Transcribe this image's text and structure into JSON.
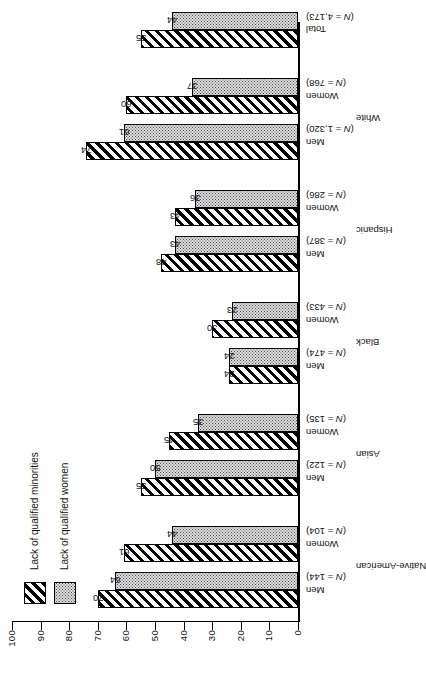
{
  "chart_data": {
    "type": "bar",
    "title": "",
    "subtitle": "",
    "xlabel": "",
    "ylabel": "",
    "orientation": "vertical-bars-rotated-90ccw",
    "ylim": [
      0,
      100
    ],
    "yticks": [
      0,
      10,
      20,
      30,
      40,
      50,
      60,
      70,
      80,
      90,
      100
    ],
    "ytick_labels": [
      "0",
      "10",
      "20",
      "30",
      "40",
      "50",
      "60",
      "70",
      "80",
      "90",
      "100"
    ],
    "grid": false,
    "legend_position": "left-middle",
    "categories": [
      "Native-American Men",
      "Native-American Women",
      "Asian Men",
      "Asian Women",
      "Black Men",
      "Black Women",
      "Hispanic Men",
      "Hispanic Women",
      "White Men",
      "White Women",
      "Total"
    ],
    "series": [
      {
        "name": "Lack of qualified minorities",
        "pattern": "diagonal-hatch",
        "values": [
          70,
          61,
          55,
          45,
          24,
          30,
          48,
          43,
          74,
          60,
          55
        ]
      },
      {
        "name": "Lack of qualified women",
        "pattern": "stipple-dots",
        "values": [
          64,
          44,
          50,
          35,
          24,
          23,
          43,
          36,
          61,
          37,
          44
        ]
      }
    ],
    "groups": [
      {
        "name": "Native-American",
        "columns": [
          {
            "sex": "Men",
            "n_label": "(N = 144)",
            "minorities": 70,
            "women": 64
          },
          {
            "sex": "Women",
            "n_label": "(N = 104)",
            "minorities": 61,
            "women": 44
          }
        ]
      },
      {
        "name": "Asian",
        "columns": [
          {
            "sex": "Men",
            "n_label": "(N = 122)",
            "minorities": 55,
            "women": 50
          },
          {
            "sex": "Women",
            "n_label": "(N = 135)",
            "minorities": 45,
            "women": 35
          }
        ]
      },
      {
        "name": "Black",
        "columns": [
          {
            "sex": "Men",
            "n_label": "(N = 474)",
            "minorities": 24,
            "women": 24
          },
          {
            "sex": "Women",
            "n_label": "(N = 433)",
            "minorities": 30,
            "women": 23
          }
        ]
      },
      {
        "name": "Hispanic",
        "columns": [
          {
            "sex": "Men",
            "n_label": "(N = 387)",
            "minorities": 48,
            "women": 43
          },
          {
            "sex": "Women",
            "n_label": "(N = 286)",
            "minorities": 43,
            "women": 36
          }
        ]
      },
      {
        "name": "White",
        "columns": [
          {
            "sex": "Men",
            "n_label": "(N = 1,320)",
            "minorities": 74,
            "women": 61
          },
          {
            "sex": "Women",
            "n_label": "(N = 768)",
            "minorities": 60,
            "women": 37
          }
        ]
      },
      {
        "name": "Total",
        "columns": [
          {
            "sex": "",
            "n_label": "(N = 4,173)",
            "minorities": 55,
            "women": 44
          }
        ]
      }
    ]
  },
  "legend": {
    "items": [
      {
        "label": "Lack of qualified minorities",
        "pattern": "diagonal-hatch"
      },
      {
        "label": "Lack of qualified women",
        "pattern": "stipple-dots"
      }
    ]
  },
  "axis": {
    "labels": [
      "100",
      "90",
      "80",
      "70",
      "60",
      "50",
      "40",
      "30",
      "20",
      "10",
      "0"
    ]
  }
}
